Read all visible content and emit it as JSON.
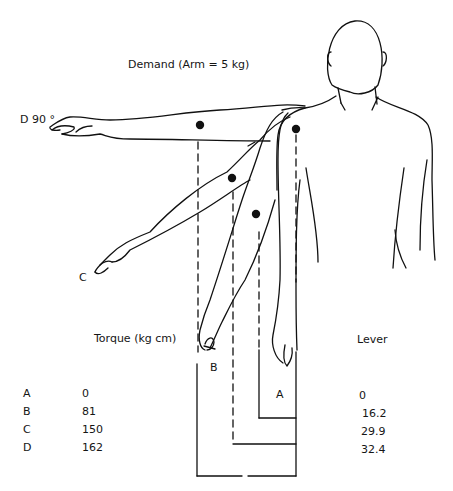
{
  "figure": {
    "title": "Demand (Arm = 5 kg)",
    "positions": [
      {
        "key": "D",
        "label": "D 90 °"
      },
      {
        "key": "C",
        "label": "C"
      },
      {
        "key": "B",
        "label": "B"
      },
      {
        "key": "A",
        "label": "A"
      }
    ]
  },
  "table": {
    "headers": {
      "torque": "Torque (kg cm)",
      "lever": "Lever"
    },
    "rows": [
      {
        "key": "A",
        "torque": "0",
        "lever": "0"
      },
      {
        "key": "B",
        "torque": "81",
        "lever": "16.2"
      },
      {
        "key": "C",
        "torque": "150",
        "lever": "29.9"
      },
      {
        "key": "D",
        "torque": "162",
        "lever": "32.4"
      }
    ]
  },
  "colors": {
    "ink": "#111111",
    "background": "#ffffff"
  }
}
